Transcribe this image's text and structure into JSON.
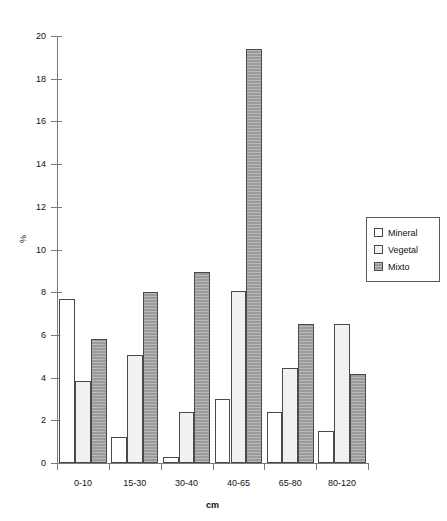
{
  "chart_data": {
    "type": "bar",
    "title": "",
    "subtitle": "",
    "xlabel": "cm",
    "ylabel": "%",
    "categories": [
      "0-10",
      "15-30",
      "30-40",
      "40-65",
      "65-80",
      "80-120"
    ],
    "series": [
      {
        "name": "Mineral",
        "color": "#ffffff",
        "values": [
          7.7,
          1.2,
          0.3,
          3.0,
          2.4,
          1.5
        ]
      },
      {
        "name": "Vegetal",
        "color": "#f1f1f1",
        "values": [
          3.85,
          5.05,
          2.4,
          8.05,
          4.45,
          6.5
        ]
      },
      {
        "name": "Mixto",
        "color": "#9b9b9b",
        "values": [
          5.8,
          8.0,
          8.95,
          19.4,
          6.5,
          4.15
        ]
      }
    ],
    "ylim": [
      0,
      20
    ],
    "yticks": [
      0,
      2,
      4,
      6,
      8,
      10,
      12,
      14,
      16,
      18,
      20
    ],
    "ytick_labels": [
      "0",
      "2",
      "4",
      "6",
      "8",
      "10",
      "12",
      "14",
      "16",
      "18",
      "20"
    ],
    "grid": false,
    "legend_position": "right",
    "axis_color": "#7a7a7a",
    "bar_border_color": "#4a4a4a",
    "background_color": "#ffffff"
  },
  "legend": {
    "items": [
      {
        "label": "Mineral",
        "swatch": "legend-swatch-mineral"
      },
      {
        "label": "Vegetal",
        "swatch": "legend-swatch-vegetal"
      },
      {
        "label": "Mixto",
        "swatch": "legend-swatch-mixto"
      }
    ]
  }
}
